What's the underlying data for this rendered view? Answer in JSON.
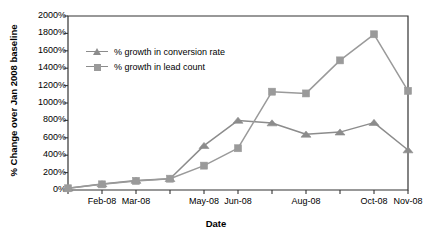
{
  "chart_data": {
    "type": "line",
    "title": "",
    "xlabel": "Date",
    "ylabel": "% Change over Jan 2008 baseline",
    "ylim": [
      0,
      2000
    ],
    "grid": false,
    "legend_position": "upper-left-inside",
    "y_tick_labels": [
      "2000%",
      "1800%",
      "1600%",
      "1400%",
      "1200%",
      "1000%",
      "800%",
      "600%",
      "400%",
      "200%",
      "0%"
    ],
    "y_ticks": [
      2000,
      1800,
      1600,
      1400,
      1200,
      1000,
      800,
      600,
      400,
      200,
      0
    ],
    "x_tick_labels": [
      "Feb-08",
      "Mar-08",
      "May-08",
      "Jun-08",
      "Aug-08",
      "Oct-08",
      "Nov-08"
    ],
    "categories": [
      "Jan-08",
      "Feb-08",
      "Mar-08",
      "Apr-08",
      "May-08",
      "Jun-08",
      "Jul-08",
      "Aug-08",
      "Sep-08",
      "Oct-08",
      "Nov-08"
    ],
    "series": [
      {
        "name": "% growth in conversion rate",
        "marker": "triangle",
        "color": "#8c8c8c",
        "values": [
          20,
          70,
          110,
          130,
          510,
          800,
          770,
          640,
          665,
          775,
          460
        ]
      },
      {
        "name": "% growth in lead count",
        "marker": "square",
        "color": "#9a9a9a",
        "values": [
          20,
          65,
          105,
          130,
          280,
          480,
          1130,
          1110,
          1490,
          1790,
          1140
        ]
      }
    ]
  },
  "legend": {
    "items": [
      {
        "label": "% growth in conversion rate"
      },
      {
        "label": "% growth in lead count"
      }
    ]
  },
  "axis": {
    "x_title": "Date",
    "y_title": "% Change over Jan 2008 baseline"
  },
  "colors": {
    "series1": "#8c8c8c",
    "series2": "#9a9a9a",
    "axis": "#333333",
    "text": "#000000"
  }
}
